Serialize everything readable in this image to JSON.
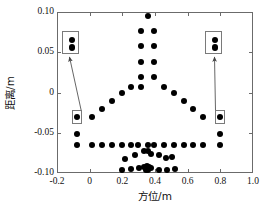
{
  "chart_data": {
    "type": "scatter",
    "title": "",
    "xlabel": "方位/m",
    "ylabel": "距离/m",
    "xlim": [
      -0.2,
      1.0
    ],
    "ylim": [
      -0.1,
      0.1
    ],
    "xticks": [
      -0.2,
      0,
      0.2,
      0.4,
      0.6,
      0.8,
      1.0
    ],
    "xticklabels": [
      "-0.2",
      "0",
      "0.2",
      "0.4",
      "0.6",
      "0.8",
      "1.0"
    ],
    "yticks": [
      -0.1,
      -0.05,
      0,
      0.05,
      0.1
    ],
    "yticklabels": [
      "-0.10",
      "-0.05",
      "0",
      "0.05",
      "0.10"
    ],
    "grid": false,
    "legend": null,
    "marker": "filled-circle",
    "marker_color": "#000000",
    "points": [
      [
        0.355,
        0.095
      ],
      [
        0.315,
        0.077
      ],
      [
        0.395,
        0.077
      ],
      [
        0.315,
        0.058
      ],
      [
        0.395,
        0.058
      ],
      [
        0.315,
        0.038
      ],
      [
        0.395,
        0.038
      ],
      [
        0.315,
        0.019
      ],
      [
        0.395,
        0.019
      ],
      [
        0.255,
        0.007
      ],
      [
        0.315,
        0.007
      ],
      [
        0.455,
        0.007
      ],
      [
        0.195,
        0.0
      ],
      [
        0.515,
        0.0
      ],
      [
        0.135,
        -0.011
      ],
      [
        0.575,
        -0.011
      ],
      [
        0.075,
        -0.021
      ],
      [
        0.635,
        -0.021
      ],
      [
        0.015,
        -0.031
      ],
      [
        0.695,
        -0.031
      ],
      [
        -0.075,
        -0.031
      ],
      [
        0.795,
        -0.031
      ],
      [
        -0.075,
        -0.052
      ],
      [
        0.795,
        -0.052
      ],
      [
        -0.075,
        -0.065
      ],
      [
        0.015,
        -0.065
      ],
      [
        0.075,
        -0.065
      ],
      [
        0.135,
        -0.065
      ],
      [
        0.195,
        -0.065
      ],
      [
        0.255,
        -0.065
      ],
      [
        0.295,
        -0.065
      ],
      [
        0.355,
        -0.065
      ],
      [
        0.395,
        -0.065
      ],
      [
        0.455,
        -0.065
      ],
      [
        0.515,
        -0.065
      ],
      [
        0.575,
        -0.065
      ],
      [
        0.635,
        -0.065
      ],
      [
        0.695,
        -0.065
      ],
      [
        0.795,
        -0.065
      ],
      [
        0.215,
        -0.083
      ],
      [
        0.275,
        -0.078
      ],
      [
        0.335,
        -0.073
      ],
      [
        0.355,
        -0.073
      ],
      [
        0.375,
        -0.076
      ],
      [
        0.425,
        -0.078
      ],
      [
        0.465,
        -0.081
      ],
      [
        0.505,
        -0.08
      ],
      [
        0.195,
        -0.096
      ],
      [
        0.255,
        -0.095
      ],
      [
        0.305,
        -0.094
      ],
      [
        0.335,
        -0.092
      ],
      [
        0.352,
        -0.091
      ],
      [
        0.365,
        -0.092
      ],
      [
        0.345,
        -0.096
      ],
      [
        0.36,
        -0.096
      ],
      [
        0.375,
        -0.094
      ],
      [
        0.425,
        -0.096
      ],
      [
        0.475,
        -0.096
      ],
      [
        0.525,
        -0.095
      ]
    ],
    "callouts": [
      {
        "name": "left-callout",
        "source_point": [
          -0.075,
          -0.031
        ],
        "magnified_points": [
          [
            -0.078,
            -0.03
          ],
          [
            -0.072,
            -0.033
          ]
        ],
        "box_label": ""
      },
      {
        "name": "right-callout",
        "source_point": [
          0.795,
          -0.031
        ],
        "magnified_points": [
          [
            0.792,
            -0.03
          ],
          [
            0.798,
            -0.033
          ]
        ],
        "box_label": ""
      }
    ]
  },
  "figure": {
    "background": "#ffffff",
    "frame_color": "#6b6b6b",
    "annotation_box_color": "#7a7a7a",
    "leader_color": "#555555"
  }
}
